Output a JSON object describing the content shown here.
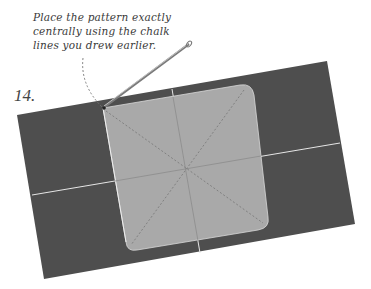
{
  "instruction": {
    "lines": [
      "Place the pattern exactly",
      "centrally using the chalk",
      "lines you drew earlier."
    ]
  },
  "step_number": "14.",
  "illustration": {
    "fabric_color": "#4e4e4e",
    "pattern_color": "#a9a9a9",
    "chalk_line_color": "#e8e8e8",
    "needle_color": "#8a8a8a"
  }
}
